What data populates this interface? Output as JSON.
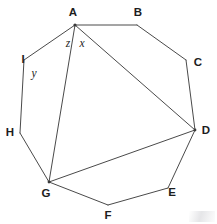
{
  "figure": {
    "shape_type": "nonagon",
    "canvas": {
      "width": 217,
      "height": 224,
      "background": "#ffffff"
    },
    "style": {
      "stroke_color": "#4a4a4a",
      "stroke_width": 1,
      "label_color": "#1d1d1d",
      "vertex_dot_color": "#3a3a3a"
    },
    "vertices": [
      {
        "id": "A",
        "label": "A",
        "x": 75,
        "y": 25,
        "label_x": 73,
        "label_y": 13
      },
      {
        "id": "B",
        "label": "B",
        "x": 137,
        "y": 25,
        "label_x": 138,
        "label_y": 13
      },
      {
        "id": "C",
        "label": "C",
        "x": 186,
        "y": 60,
        "label_x": 198,
        "label_y": 63
      },
      {
        "id": "D",
        "label": "D",
        "x": 195,
        "y": 130,
        "label_x": 206,
        "label_y": 131
      },
      {
        "id": "E",
        "label": "E",
        "x": 168,
        "y": 188,
        "label_x": 172,
        "label_y": 193
      },
      {
        "id": "F",
        "label": "F",
        "x": 108,
        "y": 205,
        "label_x": 108,
        "label_y": 216
      },
      {
        "id": "G",
        "label": "G",
        "x": 49,
        "y": 182,
        "label_x": 46,
        "label_y": 194
      },
      {
        "id": "H",
        "label": "H",
        "x": 20,
        "y": 133,
        "label_x": 10,
        "label_y": 133
      },
      {
        "id": "I",
        "label": "I",
        "x": 24,
        "y": 60,
        "label_x": 23,
        "label_y": 60
      }
    ],
    "edges": [
      {
        "from": "A",
        "to": "B"
      },
      {
        "from": "B",
        "to": "C"
      },
      {
        "from": "C",
        "to": "D"
      },
      {
        "from": "D",
        "to": "E"
      },
      {
        "from": "E",
        "to": "F"
      },
      {
        "from": "F",
        "to": "G"
      },
      {
        "from": "G",
        "to": "H"
      },
      {
        "from": "H",
        "to": "I"
      },
      {
        "from": "I",
        "to": "A"
      }
    ],
    "diagonals": [
      {
        "id": "AD",
        "from": "A",
        "to": "D"
      },
      {
        "id": "AG",
        "from": "A",
        "to": "G"
      },
      {
        "id": "GD",
        "from": "G",
        "to": "D"
      }
    ],
    "angle_labels": [
      {
        "id": "x",
        "label": "x",
        "at_vertex": "A",
        "x": 82,
        "y": 44
      },
      {
        "id": "z",
        "label": "z",
        "at_vertex": "A",
        "x": 68,
        "y": 44
      },
      {
        "id": "y",
        "label": "y",
        "at_vertex": "I",
        "x": 34,
        "y": 74
      }
    ]
  }
}
